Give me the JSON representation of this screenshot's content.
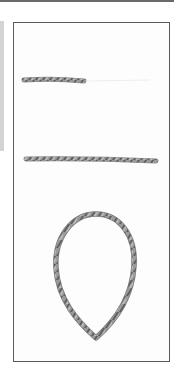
{
  "figure": {
    "items": [
      {
        "name": "short-twisted-cord",
        "kind": "straight",
        "approx_box": [
          24,
          76,
          84,
          84
        ]
      },
      {
        "name": "long-twisted-cord",
        "kind": "straight",
        "approx_box": [
          25,
          155,
          157,
          164
        ]
      },
      {
        "name": "cord-loop",
        "kind": "loop",
        "approx_box": [
          53,
          213,
          136,
          341
        ]
      }
    ],
    "colors": {
      "cord": "#7a7a7a",
      "cord_highlight": "#b8b8b8",
      "frame_border": "#5a5a5a",
      "side_strip": "#d4d4d4"
    }
  }
}
